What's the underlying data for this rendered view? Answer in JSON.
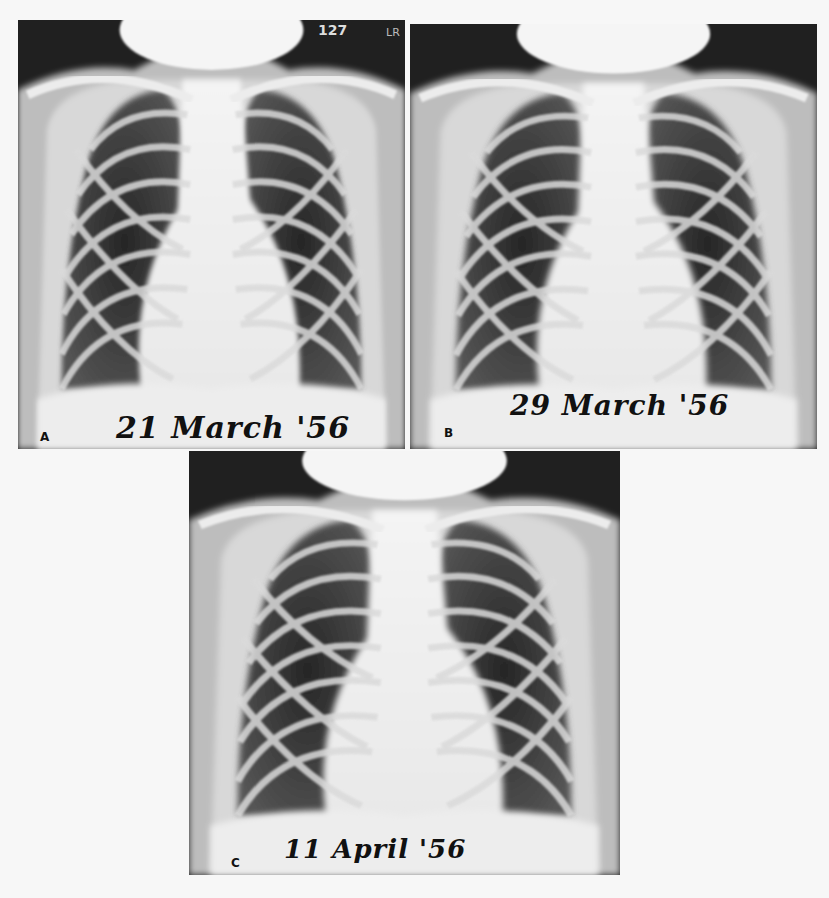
{
  "figure": {
    "panels": [
      {
        "id": "A",
        "letter": "A",
        "date_caption": "21 March '56",
        "film_marker": "LR",
        "film_number": "127"
      },
      {
        "id": "B",
        "letter": "B",
        "date_caption": "29 March '56"
      },
      {
        "id": "C",
        "letter": "C",
        "date_caption": "11 April '56"
      }
    ],
    "background_color": "#f7f7f7",
    "film_dark_color": "#202020",
    "film_light_color": "#f2f2f2"
  }
}
